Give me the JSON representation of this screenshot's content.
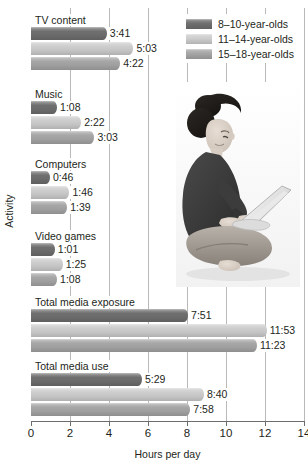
{
  "chart_data": {
    "type": "bar",
    "orientation": "horizontal",
    "title": "",
    "xlabel": "Hours per day",
    "ylabel": "Activity",
    "xlim": [
      0,
      14
    ],
    "xticks": [
      0,
      2,
      4,
      6,
      8,
      10,
      12,
      14
    ],
    "xtick_labels": [
      "0",
      "2",
      "4",
      "6",
      "8",
      "10",
      "12",
      "14"
    ],
    "grid": "vertical",
    "legend_position": "top-right",
    "categories": [
      "TV content",
      "Music",
      "Computers",
      "Video games",
      "Total media exposure",
      "Total media use"
    ],
    "series": [
      {
        "name": "8–10-year-olds",
        "color": "#6f6f6f",
        "labels": [
          "3:41",
          "1:08",
          "0:46",
          "1:01",
          "7:51",
          "5:29"
        ],
        "values": [
          3.683,
          1.133,
          0.767,
          1.017,
          7.85,
          5.483
        ]
      },
      {
        "name": "11–14-year-olds",
        "color": "#cdcdcd",
        "labels": [
          "5:03",
          "2:22",
          "1:46",
          "1:25",
          "11:53",
          "8:40"
        ],
        "values": [
          5.05,
          2.367,
          1.767,
          1.417,
          11.883,
          8.667
        ]
      },
      {
        "name": "15–18-year-olds",
        "color": "#a6a6a6",
        "labels": [
          "4:22",
          "3:03",
          "1:39",
          "1:08",
          "11:23",
          "7:58"
        ],
        "values": [
          4.367,
          3.05,
          1.65,
          1.133,
          11.383,
          7.967
        ]
      }
    ]
  },
  "legend": {
    "items": [
      {
        "label": "8–10-year-olds",
        "color": "#6f6f6f"
      },
      {
        "label": "11–14-year-olds",
        "color": "#cdcdcd"
      },
      {
        "label": "15–18-year-olds",
        "color": "#a6a6a6"
      }
    ]
  },
  "photo": {
    "alt": "Young woman sitting cross-legged on the floor using a laptop"
  }
}
